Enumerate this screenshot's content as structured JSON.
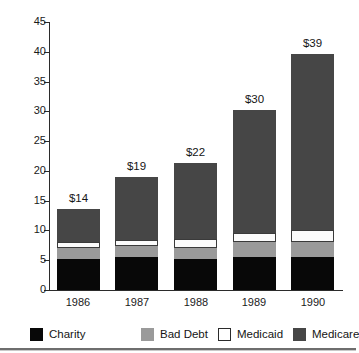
{
  "chart_data": {
    "type": "bar",
    "subtype": "stacked-bar",
    "title": "",
    "xlabel": "",
    "ylabel": "",
    "ylim": [
      0,
      45
    ],
    "ytick_values": [
      0,
      5,
      10,
      15,
      20,
      25,
      30,
      35,
      40,
      45
    ],
    "ytick_labels": [
      "0",
      "5",
      "10",
      "15",
      "20",
      "25",
      "30",
      "35",
      "40",
      "45"
    ],
    "grid": false,
    "legend_position": "bottom",
    "categories": [
      "1986",
      "1987",
      "1988",
      "1989",
      "1990"
    ],
    "series": [
      {
        "name": "Charity",
        "color": "#080808",
        "values": [
          5.2,
          5.5,
          5.2,
          5.6,
          5.6
        ]
      },
      {
        "name": "Bad Debt",
        "color": "#9a9a9a",
        "values": [
          1.8,
          1.9,
          1.9,
          2.4,
          2.5
        ]
      },
      {
        "name": "Medicaid",
        "color": "#ffffff",
        "values": [
          1.1,
          1.0,
          1.5,
          1.5,
          2.0
        ]
      },
      {
        "name": "Medicare",
        "color": "#464646",
        "values": [
          5.5,
          10.6,
          12.7,
          20.7,
          29.6
        ]
      }
    ],
    "totals": [
      13.6,
      19.0,
      21.3,
      30.2,
      39.7
    ],
    "bar_labels": [
      "$14",
      "$19",
      "$22",
      "$30",
      "$39"
    ],
    "annotations": []
  },
  "legend": {
    "items": [
      {
        "label": "Charity",
        "swatch": "charity-swatch"
      },
      {
        "label": "Bad Debt",
        "swatch": "bad-debt-swatch"
      },
      {
        "label": "Medicaid",
        "swatch": "medicaid-swatch"
      },
      {
        "label": "Medicare",
        "swatch": "medicare-swatch"
      }
    ]
  },
  "colors": {
    "charity": "#080808",
    "bad_debt": "#9a9a9a",
    "medicaid": "#ffffff",
    "medicare": "#464646",
    "axis": "#2b2b2b",
    "text": "#1a1a1a",
    "background": "#ffffff"
  }
}
